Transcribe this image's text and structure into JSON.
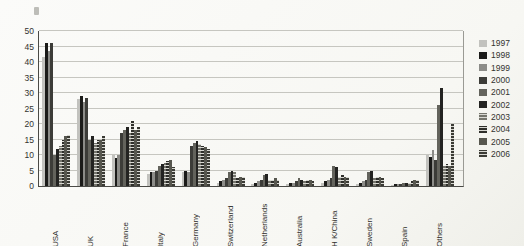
{
  "chart_data": {
    "type": "bar",
    "title": "",
    "xlabel": "",
    "ylabel": "",
    "ylim": [
      0,
      50
    ],
    "ytick_step": 5,
    "grid": true,
    "legend_position": "right",
    "categories": [
      "USA",
      "UK",
      "France",
      "Italy",
      "Germany",
      "Switzerland",
      "Netherlands",
      "Australia",
      "H K/China",
      "Sweden",
      "Spain",
      "Others"
    ],
    "series": [
      {
        "name": "1997",
        "color": "#c2c2be",
        "hatched": false,
        "values": [
          41.5,
          28,
          10,
          4,
          4.5,
          1,
          0.5,
          0.5,
          1,
          0.5,
          0.3,
          10
        ]
      },
      {
        "name": "1998",
        "color": "#1b1b19",
        "hatched": false,
        "values": [
          46,
          29,
          9,
          4.5,
          5,
          1.5,
          1,
          1,
          1.5,
          1,
          0.5,
          9.5
        ]
      },
      {
        "name": "1999",
        "color": "#8c8c88",
        "hatched": false,
        "values": [
          43.5,
          27,
          10,
          4.5,
          4.5,
          2,
          1.5,
          1,
          2,
          1.5,
          0.5,
          11.5
        ]
      },
      {
        "name": "2000",
        "color": "#3c3c38",
        "hatched": false,
        "values": [
          46,
          28.5,
          17,
          5,
          13,
          2.5,
          2,
          1.5,
          2.5,
          2,
          0.5,
          8.5
        ]
      },
      {
        "name": "2001",
        "color": "#63635c",
        "hatched": false,
        "values": [
          10,
          15,
          18,
          6.5,
          14,
          4.5,
          3.5,
          2.5,
          6.5,
          4.5,
          1,
          26
        ]
      },
      {
        "name": "2002",
        "color": "#232321",
        "hatched": false,
        "values": [
          12,
          16,
          19,
          7,
          14.5,
          5,
          4,
          2,
          6,
          5,
          1,
          31.5
        ]
      },
      {
        "name": "2003",
        "color": "#74746c",
        "hatched": true,
        "values": [
          13,
          14,
          17,
          7.5,
          13.5,
          4.5,
          2,
          1.5,
          3,
          2.5,
          1,
          6.5
        ]
      },
      {
        "name": "2004",
        "color": "#2e2e2a",
        "hatched": true,
        "values": [
          15,
          15,
          21,
          8,
          13,
          2.5,
          2,
          2,
          3.5,
          3,
          1.5,
          7
        ]
      },
      {
        "name": "2005",
        "color": "#57574f",
        "hatched": false,
        "values": [
          16,
          15,
          18,
          8.5,
          12.5,
          3,
          2.5,
          2,
          3,
          3,
          2,
          6.5
        ]
      },
      {
        "name": "2006",
        "color": "#3a3a34",
        "hatched": true,
        "values": [
          16.5,
          16,
          19,
          6,
          12,
          3,
          2,
          1.5,
          3,
          2.5,
          2,
          20
        ]
      }
    ]
  },
  "colors": {
    "axis": "#4a4a46",
    "grid": "#c6c6c0",
    "background": "#f9f9f6",
    "text": "#33332f"
  }
}
